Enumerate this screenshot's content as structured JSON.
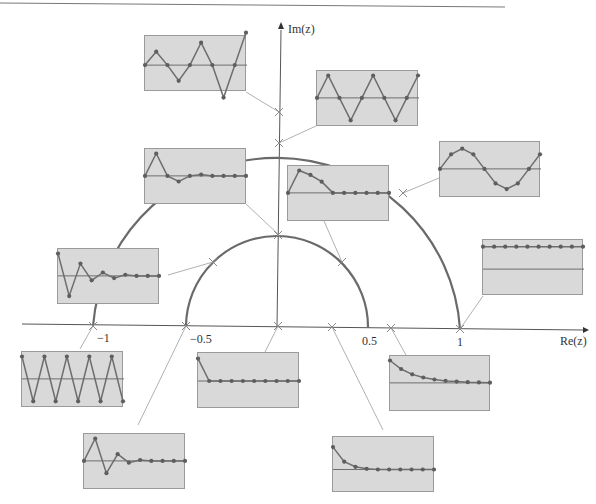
{
  "figure": {
    "type": "z-plane pole locations with corresponding impulse responses",
    "axes": {
      "x_label": "Re(z)",
      "y_label": "Im(z)",
      "x_ticks": [
        "−1",
        "−0.5",
        "0.5",
        "1"
      ]
    },
    "circles": [
      {
        "name": "unit-circle",
        "radius": 1
      },
      {
        "name": "half-circle",
        "radius": 0.5
      }
    ],
    "colors": {
      "inset_bg": "#d9d9d9",
      "inset_border": "#9a9a9a",
      "curve": "#6e6e6e",
      "axis": "#555555",
      "circle": "#6a6a6a",
      "leader": "#a8a8a8",
      "marker": "#8a8a8a"
    },
    "poles": [
      {
        "id": "p-im-1.2",
        "re": 0,
        "im": 1.17
      },
      {
        "id": "p-im-1",
        "re": 0,
        "im": 1
      },
      {
        "id": "p-im-0.5",
        "re": 0,
        "im": 0.5
      },
      {
        "id": "p-unit-45",
        "re": 0.68,
        "im": 0.72
      },
      {
        "id": "p-half-135",
        "re": -0.35,
        "im": 0.35
      },
      {
        "id": "p-half-45",
        "re": 0.35,
        "im": 0.35
      },
      {
        "id": "p-re-minus1",
        "re": -1,
        "im": 0
      },
      {
        "id": "p-re-minus0.5",
        "re": -0.5,
        "im": 0
      },
      {
        "id": "p-re-0",
        "re": 0,
        "im": 0
      },
      {
        "id": "p-re-0.3",
        "re": 0.3,
        "im": 0
      },
      {
        "id": "p-re-0.62",
        "re": 0.62,
        "im": 0
      },
      {
        "id": "p-re-1",
        "re": 1,
        "im": 0
      }
    ],
    "insets": [
      {
        "name": "growing-oscillation",
        "pole": "p-im-1.2",
        "x": 144,
        "y": 35,
        "w": 102,
        "h": 56,
        "baseline": 0.52,
        "values": [
          0,
          0.6,
          0,
          -0.7,
          0,
          1.0,
          0,
          -1.45,
          0,
          1.45
        ]
      },
      {
        "name": "sustained-oscillation-period4",
        "pole": "p-im-1",
        "x": 316,
        "y": 70,
        "w": 102,
        "h": 56,
        "baseline": 0.48,
        "values": [
          0,
          1,
          0,
          -1,
          0,
          1,
          0,
          -1,
          0,
          1
        ]
      },
      {
        "name": "damped-oscillation-period4",
        "pole": "p-im-0.5",
        "x": 144,
        "y": 148,
        "w": 102,
        "h": 56,
        "baseline": 0.48,
        "values": [
          0,
          1,
          0,
          -0.25,
          0,
          0.06,
          0,
          0,
          0,
          0
        ]
      },
      {
        "name": "damped-decay-45deg-half",
        "pole": "p-half-45",
        "x": 287,
        "y": 165,
        "w": 102,
        "h": 56,
        "baseline": 0.48,
        "values": [
          0,
          1,
          0.8,
          0.5,
          0,
          0,
          0,
          0,
          0,
          0
        ]
      },
      {
        "name": "sinusoid-unit-circle",
        "pole": "p-unit-45",
        "x": 439,
        "y": 141,
        "w": 101,
        "h": 56,
        "baseline": 0.48,
        "values": [
          0,
          0.65,
          0.9,
          0.65,
          0,
          -0.65,
          -0.9,
          -0.65,
          0,
          0.65
        ]
      },
      {
        "name": "constant-step",
        "pole": "p-re-1",
        "x": 482,
        "y": 239,
        "w": 101,
        "h": 56,
        "baseline": 0.52,
        "values": [
          1,
          1,
          1,
          1,
          1,
          1,
          1,
          1,
          1,
          1
        ]
      },
      {
        "name": "damped-oscillation-135deg-half",
        "pole": "p-half-135",
        "x": 57,
        "y": 248,
        "w": 102,
        "h": 56,
        "baseline": 0.48,
        "values": [
          1,
          -0.9,
          0.55,
          -0.2,
          0.15,
          -0.1,
          0.05,
          0,
          0,
          0
        ]
      },
      {
        "name": "alternating-sign",
        "pole": "p-re-minus1",
        "x": 21,
        "y": 351,
        "w": 102,
        "h": 56,
        "baseline": 0.48,
        "values": [
          1,
          -1,
          1,
          -1,
          1,
          -1,
          1,
          -1,
          1,
          -1
        ]
      },
      {
        "name": "impulse-at-origin",
        "pole": "p-re-0",
        "x": 197,
        "y": 352,
        "w": 102,
        "h": 56,
        "baseline": 0.5,
        "values": [
          1,
          0,
          0,
          0,
          0,
          0,
          0,
          0,
          0,
          0
        ]
      },
      {
        "name": "slow-exponential-decay",
        "pole": "p-re-0.62",
        "x": 389,
        "y": 355,
        "w": 101,
        "h": 56,
        "baseline": 0.48,
        "values": [
          1,
          0.62,
          0.38,
          0.24,
          0.15,
          0.09,
          0.06,
          0.03,
          0.02,
          0.01
        ]
      },
      {
        "name": "damped-alternating",
        "pole": "p-re-minus0.5",
        "x": 83,
        "y": 433,
        "w": 102,
        "h": 56,
        "baseline": 0.48,
        "values": [
          0,
          1,
          -0.55,
          0.3,
          -0.08,
          0.04,
          0,
          0,
          0,
          0
        ]
      },
      {
        "name": "fast-exponential-decay",
        "pole": "p-re-0.3",
        "x": 332,
        "y": 436,
        "w": 102,
        "h": 56,
        "baseline": 0.58,
        "values": [
          1,
          0.35,
          0.12,
          0.03,
          0,
          0,
          0,
          0,
          0,
          0
        ]
      }
    ]
  }
}
